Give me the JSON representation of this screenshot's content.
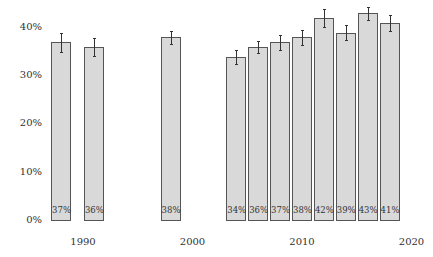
{
  "chart_data": {
    "type": "bar",
    "title": "",
    "xlabel": "",
    "ylabel": "",
    "x": [
      1988,
      1991,
      1998,
      2004,
      2006,
      2008,
      2010,
      2012,
      2014,
      2016,
      2018
    ],
    "values": [
      37,
      36,
      38,
      34,
      36,
      37,
      38,
      42,
      39,
      43,
      41
    ],
    "value_labels": [
      "37%",
      "36%",
      "38%",
      "34%",
      "36%",
      "37%",
      "38%",
      "42%",
      "39%",
      "43%",
      "41%"
    ],
    "error_bars": [
      2.0,
      1.9,
      1.4,
      1.5,
      1.2,
      1.6,
      1.6,
      1.8,
      1.5,
      1.4,
      1.6
    ],
    "ylim": [
      0,
      40
    ],
    "yticks": [
      "0%",
      "10%",
      "20%",
      "30%",
      "40%"
    ],
    "xticks": [
      "1990",
      "2000",
      "2010",
      "2020"
    ],
    "grid": false,
    "legend": null,
    "bar_color": "#d9d9d9",
    "bar_edge_color": "#555555"
  }
}
